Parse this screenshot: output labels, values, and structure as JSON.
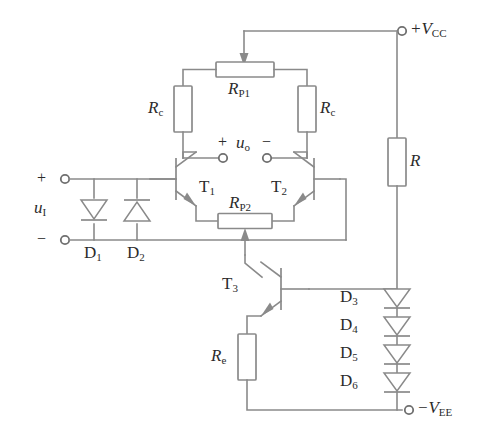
{
  "figure": {
    "kind": "schematic",
    "line_color": "#8a8a8a",
    "text_color": "#2b2b2b",
    "background": "#ffffff"
  },
  "labels": {
    "input_source": "u",
    "input_source_sub": "I",
    "input_plus": "+",
    "input_minus": "−",
    "diode_d1": "D",
    "diode_d1_sub": "1",
    "diode_d2": "D",
    "diode_d2_sub": "2",
    "rc_left": "R",
    "rc_left_sub": "c",
    "rc_right": "R",
    "rc_right_sub": "c",
    "rp1": "R",
    "rp1_sub": "P1",
    "rp2": "R",
    "rp2_sub": "P2",
    "re": "R",
    "re_sub": "e",
    "r_bias": "R",
    "t1": "T",
    "t1_sub": "1",
    "t2": "T",
    "t2_sub": "2",
    "t3": "T",
    "t3_sub": "3",
    "output": "u",
    "output_sub": "o",
    "output_plus": "+",
    "output_minus": "−",
    "vcc": "+V",
    "vcc_sub": "CC",
    "vee": "−V",
    "vee_sub": "EE",
    "diode_d3": "D",
    "diode_d3_sub": "3",
    "diode_d4": "D",
    "diode_d4_sub": "4",
    "diode_d5": "D",
    "diode_d5_sub": "5",
    "diode_d6": "D",
    "diode_d6_sub": "6"
  },
  "components": [
    {
      "id": "u_I",
      "type": "input-port-pair",
      "label": "u_I"
    },
    {
      "id": "D1",
      "type": "diode",
      "label": "D1",
      "orientation": "cathode-down"
    },
    {
      "id": "D2",
      "type": "diode",
      "label": "D2",
      "orientation": "cathode-up"
    },
    {
      "id": "T1",
      "type": "npn-transistor",
      "label": "T1"
    },
    {
      "id": "T2",
      "type": "npn-transistor",
      "label": "T2"
    },
    {
      "id": "T3",
      "type": "npn-transistor",
      "label": "T3"
    },
    {
      "id": "Rc_left",
      "type": "resistor",
      "label": "Rc"
    },
    {
      "id": "Rc_right",
      "type": "resistor",
      "label": "Rc"
    },
    {
      "id": "RP1",
      "type": "potentiometer",
      "label": "RP1",
      "wiper": "top"
    },
    {
      "id": "RP2",
      "type": "potentiometer",
      "label": "RP2",
      "wiper": "bottom"
    },
    {
      "id": "Re",
      "type": "resistor",
      "label": "Re"
    },
    {
      "id": "R",
      "type": "resistor",
      "label": "R"
    },
    {
      "id": "D3",
      "type": "diode",
      "label": "D3",
      "orientation": "cathode-down"
    },
    {
      "id": "D4",
      "type": "diode",
      "label": "D4",
      "orientation": "cathode-down"
    },
    {
      "id": "D5",
      "type": "diode",
      "label": "D5",
      "orientation": "cathode-down"
    },
    {
      "id": "D6",
      "type": "diode",
      "label": "D6",
      "orientation": "cathode-down"
    },
    {
      "id": "VCC",
      "type": "supply-terminal",
      "label": "+VCC"
    },
    {
      "id": "VEE",
      "type": "supply-terminal",
      "label": "-VEE"
    },
    {
      "id": "u_o",
      "type": "output-port-pair",
      "label": "u_o"
    }
  ]
}
